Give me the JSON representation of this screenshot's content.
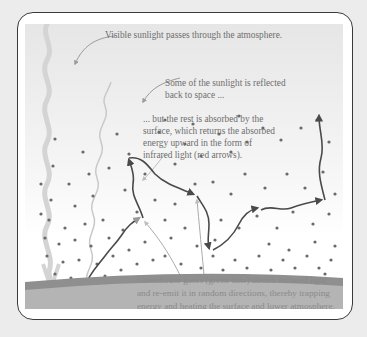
{
  "diagram": {
    "labels": {
      "visible_sunlight": "Visible sunlight passes through the atmosphere.",
      "reflected": [
        "Some of the sunlight is reflected",
        "back to space ..."
      ],
      "absorbed": [
        "... but the rest is absorbed by the",
        "surface, which returns the absorbed",
        "energy upward in the form of",
        "infrared light (red arrows)."
      ],
      "greenhouse_gases": [
        "Greenhouse gases (green dots) absorb infrared light",
        "and re-emit it in random directions, thereby trapping",
        "energy and heating the surface and lower atmosphere."
      ]
    },
    "elements": {
      "incoming_sunlight": "wavy light band descending from top-left to surface",
      "reflected_sunlight": "thin wavy line rising from surface back to space",
      "infrared_arrows": "dark arrows bouncing between gas molecules, one escaping upward",
      "gas_molecules": "scattered dots denser near surface",
      "surface": "curved ground band at bottom"
    },
    "colors": {
      "frame_border": "#3a3a3a",
      "surface_band": "#8f8f8f",
      "ground": "#b4b4b4",
      "dots": "#6a6a6a",
      "arrows": "#4a4a4a",
      "text": "#6e6e6e"
    }
  }
}
